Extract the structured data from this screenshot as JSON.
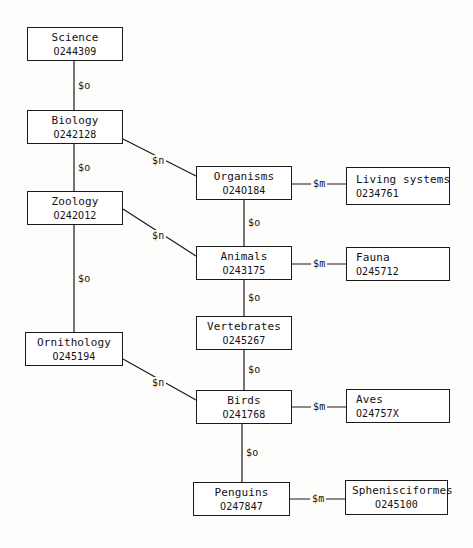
{
  "diagram": {
    "line_color": "#1a1a1a",
    "box_fill": "#ffffff",
    "text_color": "#111111"
  },
  "nodes": [
    {
      "id": "science",
      "term": "Science",
      "code": "O244309",
      "x": 27,
      "y": 27,
      "w": 96,
      "h": 34,
      "align": "center"
    },
    {
      "id": "biology",
      "term": "Biology",
      "code": "O242128",
      "x": 27,
      "y": 110,
      "w": 96,
      "h": 34,
      "align": "center"
    },
    {
      "id": "zoology",
      "term": "Zoology",
      "code": "O242O12",
      "x": 27,
      "y": 191,
      "w": 96,
      "h": 34,
      "align": "center"
    },
    {
      "id": "ornithology",
      "term": "Ornithology",
      "code": "O245194",
      "x": 25,
      "y": 332,
      "w": 98,
      "h": 34,
      "align": "center"
    },
    {
      "id": "organisms",
      "term": "Organisms",
      "code": "O24O184",
      "x": 196,
      "y": 166,
      "w": 96,
      "h": 34,
      "align": "center"
    },
    {
      "id": "animals",
      "term": "Animals",
      "code": "O243175",
      "x": 196,
      "y": 246,
      "w": 96,
      "h": 34,
      "align": "center"
    },
    {
      "id": "vertebrates",
      "term": "Vertebrates",
      "code": "O245267",
      "x": 196,
      "y": 316,
      "w": 96,
      "h": 34,
      "align": "center"
    },
    {
      "id": "birds",
      "term": "Birds",
      "code": "O241768",
      "x": 196,
      "y": 390,
      "w": 96,
      "h": 34,
      "align": "center"
    },
    {
      "id": "penguins",
      "term": "Penguins",
      "code": "O247847",
      "x": 193,
      "y": 482,
      "w": 97,
      "h": 34,
      "align": "center"
    },
    {
      "id": "living-systems",
      "term": "Living systems",
      "code": "O234761",
      "x": 346,
      "y": 167,
      "w": 104,
      "h": 38,
      "align": "left"
    },
    {
      "id": "fauna",
      "term": "Fauna",
      "code": "O245712",
      "x": 346,
      "y": 247,
      "w": 104,
      "h": 34,
      "align": "left"
    },
    {
      "id": "aves",
      "term": "Aves",
      "code": "O24757X",
      "x": 346,
      "y": 389,
      "w": 104,
      "h": 34,
      "align": "left"
    },
    {
      "id": "sphenisciformes",
      "term": "Sphenisciformes",
      "code": "O245100",
      "x": 345,
      "y": 480,
      "w": 103,
      "h": 35,
      "align": "center"
    }
  ],
  "edges": [
    {
      "id": "science-biology",
      "from": "science",
      "to": "biology",
      "kind": "vertical",
      "label": "$o",
      "x1": 74,
      "y1": 61,
      "x2": 74,
      "y2": 110
    },
    {
      "id": "biology-zoology",
      "from": "biology",
      "to": "zoology",
      "kind": "vertical",
      "label": "$o",
      "x1": 74,
      "y1": 144,
      "x2": 74,
      "y2": 191
    },
    {
      "id": "zoology-ornithology",
      "from": "zoology",
      "to": "ornithology",
      "kind": "vertical",
      "label": "$o",
      "x1": 74,
      "y1": 225,
      "x2": 74,
      "y2": 332
    },
    {
      "id": "biology-organisms",
      "from": "biology",
      "to": "organisms",
      "kind": "diagonal",
      "label": "$n",
      "x1": 123,
      "y1": 139,
      "x2": 196,
      "y2": 176
    },
    {
      "id": "zoology-animals",
      "from": "zoology",
      "to": "animals",
      "kind": "diagonal",
      "label": "$n",
      "x1": 123,
      "y1": 209,
      "x2": 196,
      "y2": 256
    },
    {
      "id": "ornithology-birds",
      "from": "ornithology",
      "to": "birds",
      "kind": "diagonal",
      "label": "$n",
      "x1": 123,
      "y1": 359,
      "x2": 196,
      "y2": 400
    },
    {
      "id": "organisms-animals",
      "from": "organisms",
      "to": "animals",
      "kind": "vertical",
      "label": "$o",
      "x1": 244,
      "y1": 200,
      "x2": 244,
      "y2": 246
    },
    {
      "id": "animals-vertebrates",
      "from": "animals",
      "to": "vertebrates",
      "kind": "vertical",
      "label": "$o",
      "x1": 244,
      "y1": 280,
      "x2": 244,
      "y2": 316
    },
    {
      "id": "vertebrates-birds",
      "from": "vertebrates",
      "to": "birds",
      "kind": "vertical",
      "label": "$o",
      "x1": 244,
      "y1": 350,
      "x2": 244,
      "y2": 390
    },
    {
      "id": "birds-penguins",
      "from": "birds",
      "to": "penguins",
      "kind": "vertical",
      "label": "$o",
      "x1": 242,
      "y1": 424,
      "x2": 242,
      "y2": 482
    },
    {
      "id": "organisms-living-systems",
      "from": "organisms",
      "to": "living-systems",
      "kind": "horizontal",
      "label": "$m",
      "x1": 292,
      "y1": 184,
      "x2": 346,
      "y2": 184
    },
    {
      "id": "animals-fauna",
      "from": "animals",
      "to": "fauna",
      "kind": "horizontal",
      "label": "$m",
      "x1": 292,
      "y1": 264,
      "x2": 346,
      "y2": 264
    },
    {
      "id": "birds-aves",
      "from": "birds",
      "to": "aves",
      "kind": "horizontal",
      "label": "$m",
      "x1": 292,
      "y1": 407,
      "x2": 346,
      "y2": 407
    },
    {
      "id": "penguins-sphenisciformes",
      "from": "penguins",
      "to": "sphenisciformes",
      "kind": "horizontal",
      "label": "$m",
      "x1": 290,
      "y1": 499,
      "x2": 345,
      "y2": 499
    }
  ]
}
